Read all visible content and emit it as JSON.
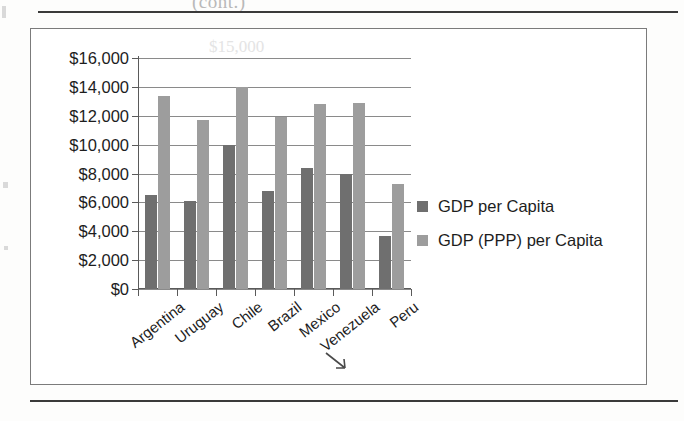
{
  "page": {
    "ghost_text_top": "(cont.)",
    "ghost_text_plot": "$15,000"
  },
  "chart_data": {
    "type": "bar",
    "title": "",
    "xlabel": "",
    "ylabel": "",
    "categories": [
      "Argentina",
      "Uruguay",
      "Chile",
      "Brazil",
      "Mexico",
      "Venezuela",
      "Peru"
    ],
    "series": [
      {
        "name": "GDP per Capita",
        "color": "#6f6f6f",
        "values": [
          6500,
          6100,
          10000,
          6800,
          8400,
          8000,
          3700
        ]
      },
      {
        "name": "GDP (PPP) per Capita",
        "color": "#9d9d9d",
        "values": [
          13400,
          11700,
          14000,
          11900,
          12800,
          12900,
          7300
        ]
      }
    ],
    "ylim": [
      0,
      16000
    ],
    "ytick_values": [
      0,
      2000,
      4000,
      6000,
      8000,
      10000,
      12000,
      14000,
      16000
    ],
    "ytick_labels": [
      "$0",
      "$2,000",
      "$4,000",
      "$6,000",
      "$8,000",
      "$10,000",
      "$12,000",
      "$14,000",
      "$16,000"
    ],
    "grid": true,
    "legend_position": "right"
  }
}
